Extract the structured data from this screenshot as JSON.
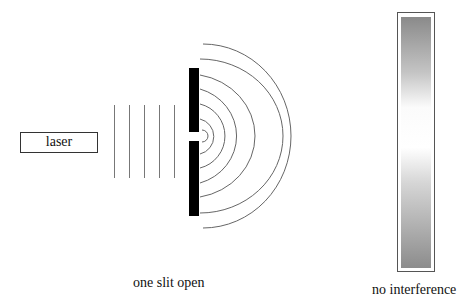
{
  "diagram": {
    "laser": {
      "label": "laser"
    },
    "barrier": {
      "description": "barrier with one slit open",
      "color": "#000000"
    },
    "incident_waves": {
      "count": 5
    },
    "diffracted_waves": {
      "count": 6
    },
    "screen": {
      "gradient_dark": "#8c8c8c",
      "gradient_light": "#ffffff"
    },
    "labels": {
      "slit_caption": "one slit open",
      "screen_caption": "no interference"
    }
  }
}
